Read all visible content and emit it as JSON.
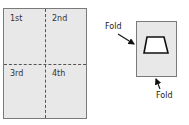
{
  "sheet": {
    "quadrants": [
      {
        "label": "1st"
      },
      {
        "label": "2nd"
      },
      {
        "label": "3rd"
      },
      {
        "label": "4th"
      }
    ]
  },
  "folded": {
    "labels": {
      "top": "Fold",
      "bottom": "Fold"
    },
    "shape": "trapezoid"
  },
  "colors": {
    "panel_fill": "#e8e8e8",
    "panel_border": "#7a7a7a",
    "dash": "#555555",
    "shape_stroke": "#111111"
  }
}
